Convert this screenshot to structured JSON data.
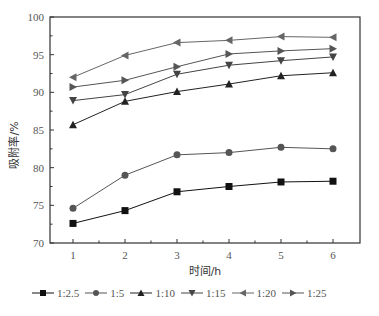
{
  "chart_data": {
    "type": "line",
    "title": "",
    "xlabel": "时间/h",
    "ylabel": "吸附率/%",
    "x": [
      1,
      2,
      3,
      4,
      5,
      6
    ],
    "xlim": [
      0.5,
      6.5
    ],
    "ylim": [
      70,
      100
    ],
    "xticks": [
      "1",
      "2",
      "3",
      "4",
      "5",
      "6"
    ],
    "yticks": [
      "70",
      "75",
      "80",
      "85",
      "90",
      "95",
      "100"
    ],
    "grid": false,
    "legend_position": "bottom",
    "series": [
      {
        "name": "1:2.5",
        "marker": "square",
        "color": "#111111",
        "values": [
          72.6,
          74.3,
          76.8,
          77.5,
          78.1,
          78.2
        ]
      },
      {
        "name": "1:5",
        "marker": "circle",
        "color": "#555555",
        "values": [
          74.6,
          79.0,
          81.7,
          82.0,
          82.7,
          82.5
        ]
      },
      {
        "name": "1:10",
        "marker": "triangle-up",
        "color": "#222222",
        "values": [
          85.7,
          88.8,
          90.1,
          91.1,
          92.2,
          92.6
        ]
      },
      {
        "name": "1:15",
        "marker": "triangle-down",
        "color": "#444444",
        "values": [
          88.9,
          89.7,
          92.4,
          93.6,
          94.2,
          94.7
        ]
      },
      {
        "name": "1:20",
        "marker": "triangle-left",
        "color": "#666666",
        "values": [
          92.0,
          94.9,
          96.6,
          96.9,
          97.4,
          97.3
        ]
      },
      {
        "name": "1:25",
        "marker": "triangle-right",
        "color": "#555555",
        "values": [
          90.7,
          91.6,
          93.4,
          95.1,
          95.5,
          95.8
        ]
      }
    ]
  }
}
